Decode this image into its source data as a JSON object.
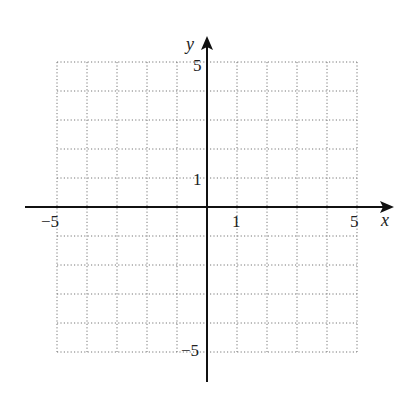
{
  "chart_data": {
    "type": "scatter",
    "title": "",
    "xlabel": "x",
    "ylabel": "y",
    "xlim": [
      -5,
      5
    ],
    "ylim": [
      -5,
      5
    ],
    "grid": true,
    "grid_style": "dotted",
    "x_tick_labels": [
      "-5",
      "1",
      "5"
    ],
    "y_tick_labels": [
      "5",
      "1",
      "-5"
    ],
    "x_tick_values": [
      -5,
      1,
      5
    ],
    "y_tick_values": [
      5,
      1,
      -5
    ],
    "series": [],
    "legend": null
  },
  "labels": {
    "x_axis": "x",
    "y_axis": "y",
    "x_neg5": "−5",
    "x_1": "1",
    "x_5": "5",
    "y_5": "5",
    "y_1": "1",
    "y_neg5": "−5"
  }
}
